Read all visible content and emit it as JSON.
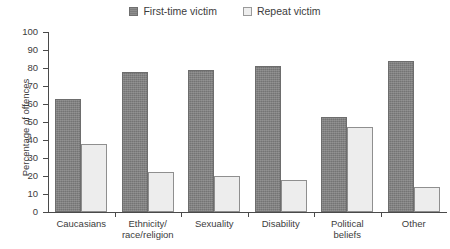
{
  "chart_data": {
    "type": "bar",
    "title": "",
    "xlabel": "",
    "ylabel": "Percentage of offences",
    "ylim": [
      0,
      100
    ],
    "ytick_labels": [
      "100",
      "90",
      "80",
      "70",
      "60",
      "50",
      "40",
      "30",
      "20",
      "10",
      "0"
    ],
    "ytick_values": [
      100,
      90,
      80,
      70,
      60,
      50,
      40,
      30,
      20,
      10,
      0
    ],
    "grid": false,
    "legend_position": "top-center",
    "categories": [
      "Caucasians",
      "Ethnicity/ race/religion",
      "Sexuality",
      "Disability",
      "Political beliefs",
      "Other"
    ],
    "category_lines": [
      [
        "Caucasians"
      ],
      [
        "Ethnicity/",
        "race/religion"
      ],
      [
        "Sexuality"
      ],
      [
        "Disability"
      ],
      [
        "Political",
        "beliefs"
      ],
      [
        "Other"
      ]
    ],
    "series": [
      {
        "name": "First-time victim",
        "color": "#7d7d7d",
        "values": [
          63,
          78,
          79,
          81,
          53,
          84
        ]
      },
      {
        "name": "Repeat victim",
        "color": "#ededed",
        "values": [
          38,
          22,
          20,
          18,
          47,
          14
        ]
      }
    ]
  },
  "legend": {
    "entries": [
      {
        "label": "First-time victim",
        "swatch": "dark-gray-swatch"
      },
      {
        "label": "Repeat victim",
        "swatch": "light-gray-swatch"
      }
    ]
  },
  "axes": {
    "y_axis_title": "Percentage of offences"
  },
  "colors": {
    "series_first": "#7d7d7d",
    "series_repeat": "#ededed",
    "axis": "#4a4a4a",
    "text": "#3c3c3c",
    "background": "#ffffff"
  }
}
